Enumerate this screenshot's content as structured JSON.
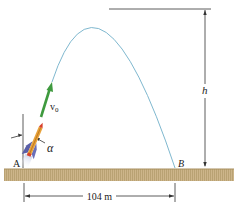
{
  "diagram": {
    "labels": {
      "point_a": "A",
      "point_b": "B",
      "height": "h",
      "velocity": "v",
      "velocity_sub": "0",
      "angle": "α",
      "distance": "104 m"
    },
    "colors": {
      "trajectory": "#7fb8cf",
      "velocity_arrow": "#3f9a3f",
      "ground": "#cdb58a",
      "ground_dark": "#b09a6e",
      "dimension_line": "#333333",
      "rocket_body": "#e8a23a",
      "rocket_tip": "#d9402a",
      "rocket_fins": "#5a5fa8"
    }
  }
}
